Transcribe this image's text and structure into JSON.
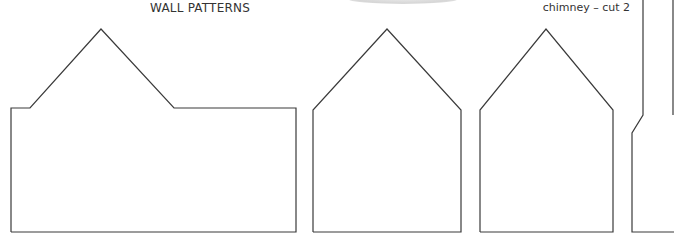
{
  "header": {
    "title": "WALL PATTERNS",
    "chimney_label": "chimney – cut 2"
  },
  "patterns": [
    {
      "name": "side-wall-with-gable",
      "points": "11,232 11,108 30,108 101,29 174,108 296,108 296,232 11,232"
    },
    {
      "name": "gable-wall-1",
      "points": "313,232 313,110 387,29 461,110 461,232 313,232"
    },
    {
      "name": "gable-wall-2",
      "points": "480,232 480,110 546,29 613,110 613,232 480,232"
    },
    {
      "name": "chimney",
      "points": "643,0 643,115 632,133 632,232 674,232"
    },
    {
      "name": "chimney-inner-edge",
      "points": "673,0 673,115"
    }
  ],
  "colors": {
    "stroke": "#3a3a3a",
    "text": "#333333",
    "background": "#ffffff"
  }
}
